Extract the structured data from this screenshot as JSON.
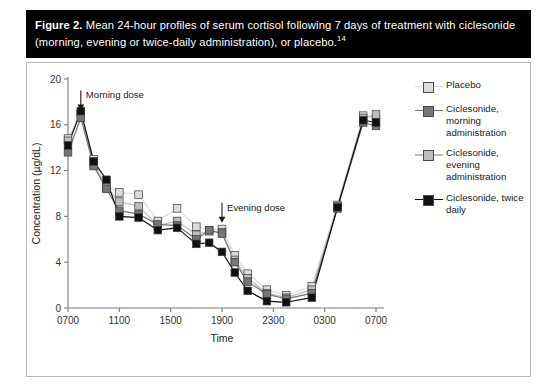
{
  "caption": {
    "figure_label": "Figure 2.",
    "text": " Mean 24-hour profiles of serum cortisol following 7 days of treatment with ciclesonide (morning, evening or twice-daily administration), or placebo.",
    "reference": "14"
  },
  "legend": {
    "items": [
      {
        "label": "Placebo",
        "color": "#dcdcdc"
      },
      {
        "label": "Ciclesonide, morning administration",
        "color": "#757575"
      },
      {
        "label": "Ciclesonide, evening administration",
        "color": "#bdbdbd"
      },
      {
        "label": "Ciclesonide, twice daily",
        "color": "#111111"
      }
    ]
  },
  "annotations": [
    {
      "name": "morning-dose",
      "label": "Morning dose",
      "x_hour": 1.0,
      "y_value": 19.0
    },
    {
      "name": "evening-dose",
      "label": "Evening dose",
      "x_hour": 12.0,
      "y_value": 9.2
    }
  ],
  "chart_data": {
    "type": "line",
    "title": "Mean 24-hour profiles of serum cortisol",
    "xlabel": "Time",
    "ylabel": "Concentration (µg/dL)",
    "xlim": [
      0,
      24
    ],
    "ylim": [
      0,
      20
    ],
    "yticks": [
      0,
      4,
      8,
      12,
      16,
      20
    ],
    "xticks": [
      0,
      4,
      8,
      12,
      16,
      20,
      24
    ],
    "xtick_labels": [
      "0700",
      "1100",
      "1500",
      "1900",
      "2300",
      "0300",
      "0700"
    ],
    "grid": false,
    "legend_position": "right",
    "x_hours": [
      0,
      1,
      2,
      3,
      4,
      5.5,
      7,
      8.5,
      10,
      11,
      12,
      13,
      14,
      15.5,
      17,
      19,
      21,
      23,
      24
    ],
    "series": [
      {
        "name": "Placebo",
        "color": "#dcdcdc",
        "values": [
          14.8,
          17.0,
          13.0,
          10.6,
          10.1,
          9.9,
          7.6,
          8.7,
          7.1,
          6.8,
          6.9,
          4.6,
          3.0,
          1.6,
          1.1,
          1.9,
          9.0,
          16.8,
          16.5
        ]
      },
      {
        "name": "Ciclesonide, morning administration",
        "color": "#757575",
        "values": [
          13.6,
          16.6,
          12.4,
          10.4,
          8.5,
          8.2,
          7.3,
          7.2,
          6.0,
          6.8,
          6.5,
          4.0,
          2.3,
          1.2,
          0.8,
          1.3,
          8.7,
          16.2,
          15.9
        ]
      },
      {
        "name": "Ciclesonide, evening administration",
        "color": "#bdbdbd",
        "values": [
          14.6,
          16.9,
          12.6,
          10.5,
          9.3,
          8.9,
          7.2,
          7.6,
          6.4,
          6.7,
          6.6,
          4.2,
          2.6,
          1.3,
          0.9,
          1.6,
          8.9,
          16.6,
          16.9
        ]
      },
      {
        "name": "Ciclesonide, twice daily",
        "color": "#111111",
        "values": [
          14.2,
          17.2,
          12.8,
          11.2,
          8.0,
          7.9,
          6.8,
          7.0,
          5.6,
          5.7,
          4.9,
          3.1,
          1.5,
          0.6,
          0.5,
          0.9,
          8.8,
          16.4,
          16.2
        ]
      }
    ]
  }
}
